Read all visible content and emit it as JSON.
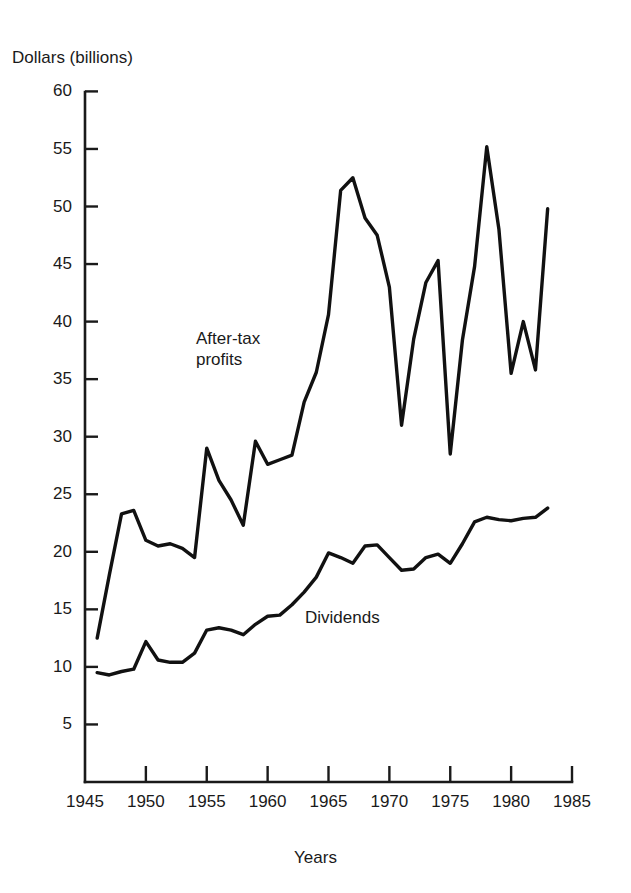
{
  "chart_data": {
    "type": "line",
    "title": "",
    "subtitle": "",
    "ylabel": "Dollars (billions)",
    "xlabel": "Years",
    "xlim": [
      1945,
      1985
    ],
    "ylim": [
      0,
      60
    ],
    "grid": false,
    "legend_position": "inline-annotations",
    "y_ticks": [
      60,
      55,
      50,
      45,
      40,
      35,
      30,
      25,
      20,
      15,
      10,
      5
    ],
    "x_ticks": [
      1945,
      1950,
      1955,
      1960,
      1965,
      1970,
      1975,
      1980,
      1985
    ],
    "x": [
      1946,
      1947,
      1948,
      1949,
      1950,
      1951,
      1952,
      1953,
      1954,
      1955,
      1956,
      1957,
      1958,
      1959,
      1960,
      1961,
      1962,
      1963,
      1964,
      1965,
      1966,
      1967,
      1968,
      1969,
      1970,
      1971,
      1972,
      1973,
      1974,
      1975,
      1976,
      1977,
      1978,
      1979,
      1980,
      1981,
      1982,
      1983
    ],
    "series": [
      {
        "name": "After-tax profits",
        "label": "After-tax\nprofits",
        "color": "#111111",
        "values": [
          12.5,
          18.0,
          23.3,
          23.6,
          21.0,
          20.5,
          20.7,
          20.3,
          19.5,
          29.0,
          26.2,
          24.5,
          22.3,
          29.6,
          27.6,
          28.0,
          28.4,
          33.0,
          35.6,
          40.6,
          51.4,
          52.5,
          49.0,
          47.5,
          43.0,
          31.0,
          38.5,
          43.4,
          45.3,
          28.5,
          38.4,
          44.8,
          55.2,
          48.0,
          35.5,
          40.0,
          35.8,
          49.8
        ],
        "min": 12.5,
        "max": 55.2
      },
      {
        "name": "Dividends",
        "label": "Dividends",
        "color": "#111111",
        "values": [
          9.5,
          9.3,
          9.6,
          9.8,
          12.2,
          10.6,
          10.4,
          10.4,
          11.2,
          13.2,
          13.4,
          13.2,
          12.8,
          13.7,
          14.4,
          14.5,
          15.4,
          16.5,
          17.8,
          19.9,
          19.5,
          19.0,
          20.5,
          20.6,
          19.5,
          18.4,
          18.5,
          19.5,
          19.8,
          19.0,
          20.7,
          22.6,
          23.0,
          22.8,
          22.7,
          22.9,
          23.0,
          23.8
        ],
        "min": 9.3,
        "max": 23.8
      }
    ]
  },
  "axes": {
    "y_title": "Dollars (billions)",
    "x_title": "Years",
    "y_labels": [
      "60",
      "55",
      "50",
      "45",
      "40",
      "35",
      "30",
      "25",
      "20",
      "15",
      "10",
      "5"
    ],
    "x_labels": [
      "1945",
      "1950",
      "1955",
      "1960",
      "1965",
      "1970",
      "1975",
      "1980",
      "1985"
    ]
  },
  "annotations": {
    "profits_line1": "After-tax",
    "profits_line2": "profits",
    "dividends": "Dividends"
  },
  "colors": {
    "line": "#111111",
    "axis": "#1a1a1a",
    "background": "#ffffff",
    "text": "#1a1a1a"
  }
}
